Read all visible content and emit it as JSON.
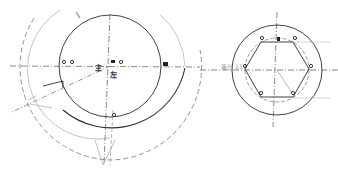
{
  "drawing": {
    "type": "technical-cad-sketch",
    "colors": {
      "line": "#2b2b2b",
      "dashed": "#6f6f6f",
      "faint": "#b0b0b0",
      "background": "#ffffff"
    },
    "left_view": {
      "center": [
        110,
        66
      ],
      "inner_circle_r": 51,
      "outer_solid_arc_r": 75,
      "thin_arc_r": 70,
      "dashed_arc_r": 93,
      "marks": {
        "near_center_a": "主",
        "near_center_b": "左",
        "right_marker": "Φ1"
      }
    },
    "right_view": {
      "center": [
        277,
        70
      ],
      "outer_circle_r": 45,
      "dashed_circle_r": 32,
      "hexagon_r": 32,
      "label_left": "等分 13"
    }
  }
}
